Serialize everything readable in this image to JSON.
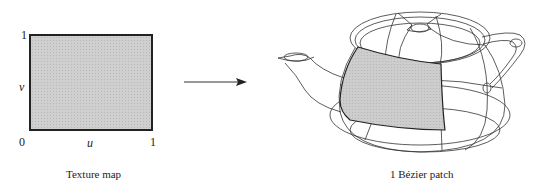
{
  "texture_map": {
    "caption": "Texture map",
    "origin_label": "0",
    "u_max_label": "1",
    "v_max_label": "1",
    "u_axis_label": "u",
    "v_axis_label": "v",
    "fill_color": "#cfcfcf",
    "border_color": "#222222"
  },
  "arrow": {
    "direction": "right",
    "color": "#222222"
  },
  "teapot": {
    "caption": "1 Bézier patch",
    "patch_fill_color": "#c8c8c8",
    "wireframe_color": "#333333"
  }
}
